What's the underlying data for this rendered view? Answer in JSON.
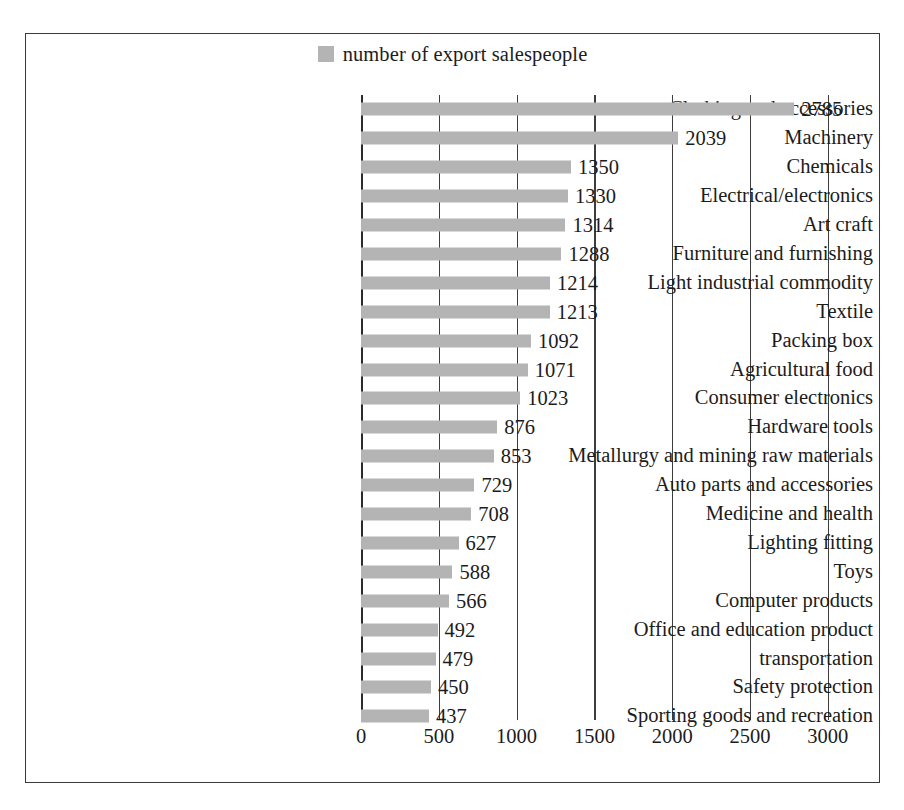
{
  "legend": {
    "swatch_name": "legend-color-swatch",
    "label": "number of export salespeople",
    "color": "#b4b4b4"
  },
  "axis": {
    "ticks": [
      "0",
      "500",
      "1000",
      "1500",
      "2000",
      "2500",
      "3000"
    ]
  },
  "chart_data": {
    "type": "bar",
    "orientation": "horizontal",
    "title": "",
    "subtitle": "",
    "xlabel": "",
    "ylabel": "",
    "xlim": [
      0,
      3000
    ],
    "xticks": [
      0,
      500,
      1000,
      1500,
      2000,
      2500,
      3000
    ],
    "grid": true,
    "legend_position": "top-center",
    "legend_entries": [
      "number of export salespeople"
    ],
    "bar_color": "#b4b4b4",
    "categories": [
      "Clothing and accessories",
      "Machinery",
      "Chemicals",
      "Electrical/electronics",
      "Art craft",
      "Furniture and furnishing",
      "Light industrial commodity",
      "Textile",
      "Packing box",
      "Agricultural food",
      "Consumer electronics",
      "Hardware tools",
      "Metallurgy and mining raw materials",
      "Auto parts and accessories",
      "Medicine and health",
      "Lighting fitting",
      "Toys",
      "Computer products",
      "Office and education product",
      "transportation",
      "Safety protection",
      "Sporting goods and recreation"
    ],
    "values": [
      2785,
      2039,
      1350,
      1330,
      1314,
      1288,
      1214,
      1213,
      1092,
      1071,
      1023,
      876,
      853,
      729,
      708,
      627,
      588,
      566,
      492,
      479,
      450,
      437
    ],
    "series": [
      {
        "name": "number of export salespeople",
        "values": [
          2785,
          2039,
          1350,
          1330,
          1314,
          1288,
          1214,
          1213,
          1092,
          1071,
          1023,
          876,
          853,
          729,
          708,
          627,
          588,
          566,
          492,
          479,
          450,
          437
        ]
      }
    ]
  }
}
